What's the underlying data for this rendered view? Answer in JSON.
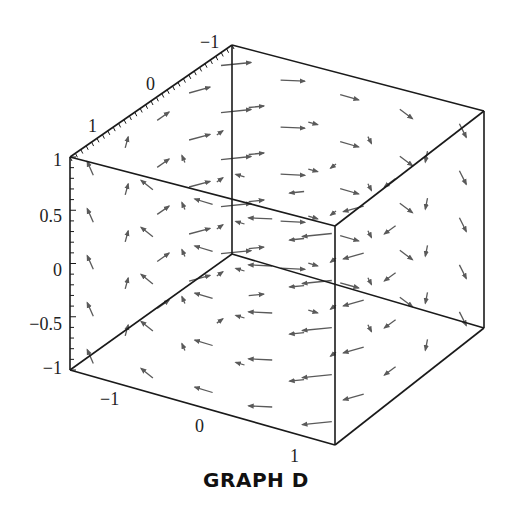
{
  "caption": "GRAPH D",
  "chart_data": {
    "type": "vector_field_3d",
    "title": "GRAPH D",
    "field_description": "Rotational field circulating about the vertical (z) axis, counterclockwise viewed from above; no vertical component",
    "field": {
      "Fx": "-y",
      "Fy": "x",
      "Fz": "0"
    },
    "axes": {
      "x": {
        "range": [
          -1,
          1
        ],
        "tick_labels": [
          "-1",
          "0",
          "1"
        ]
      },
      "y": {
        "range": [
          -1,
          1
        ],
        "tick_labels": [
          "1",
          "0",
          "-1"
        ]
      },
      "z": {
        "range": [
          -1,
          1
        ],
        "tick_labels": [
          "1",
          "0.5",
          "0",
          "−0.5",
          "−1"
        ]
      }
    },
    "box": true,
    "grid_points_per_axis": 5,
    "colors": {
      "axes": "#1a1a1a",
      "arrows": "#5a5a5a"
    }
  },
  "labels": {
    "top_axis": [
      "−1",
      "0",
      "1"
    ],
    "vertical_axis": [
      "1",
      "0.5",
      "0",
      "−0.5",
      "−1"
    ],
    "bottom_axis": [
      "−1",
      "0",
      "1"
    ]
  }
}
